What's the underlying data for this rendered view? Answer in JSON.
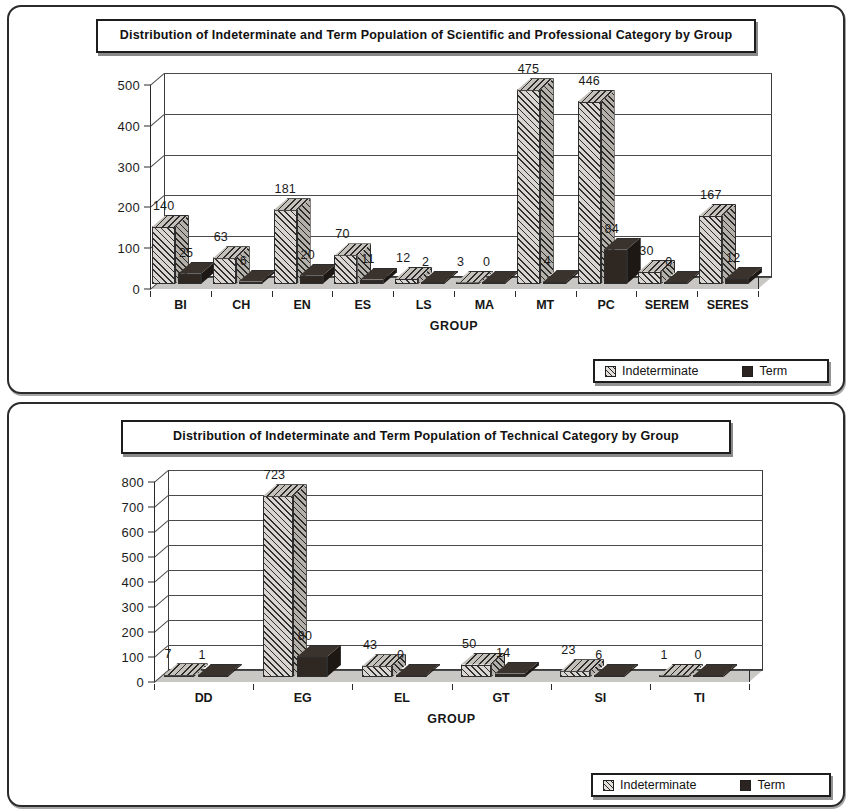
{
  "document": {
    "panels": [
      {
        "title": "Distribution of Indeterminate and Term Population of Scientific and Professional Category by Group",
        "axis_title": "GROUP",
        "legend": {
          "series_1": "Indeterminate",
          "series_2": "Term"
        }
      },
      {
        "title": "Distribution of Indeterminate and Term Population of Technical Category by Group",
        "axis_title": "GROUP",
        "legend": {
          "series_1": "Indeterminate",
          "series_2": "Term"
        }
      }
    ]
  },
  "chart_data": [
    {
      "type": "bar",
      "title": "Distribution of Indeterminate and Term Population of Scientific and Professional Category by Group",
      "xlabel": "GROUP",
      "ylabel": "",
      "ylim": [
        0,
        500
      ],
      "yticks": [
        0,
        100,
        200,
        300,
        400,
        500
      ],
      "grid": true,
      "legend_position": "bottom-right",
      "categories": [
        "BI",
        "CH",
        "EN",
        "ES",
        "LS",
        "MA",
        "MT",
        "PC",
        "SEREM",
        "SERES"
      ],
      "series": [
        {
          "name": "Indeterminate",
          "values": [
            140,
            63,
            181,
            70,
            12,
            3,
            475,
            446,
            30,
            167
          ]
        },
        {
          "name": "Term",
          "values": [
            25,
            6,
            20,
            11,
            2,
            0,
            4,
            84,
            0,
            12
          ]
        }
      ]
    },
    {
      "type": "bar",
      "title": "Distribution of Indeterminate and Term Population of Technical Category by Group",
      "xlabel": "GROUP",
      "ylabel": "",
      "ylim": [
        0,
        800
      ],
      "yticks": [
        0,
        100,
        200,
        300,
        400,
        500,
        600,
        700,
        800
      ],
      "grid": true,
      "legend_position": "bottom-right",
      "categories": [
        "DD",
        "EG",
        "EL",
        "GT",
        "SI",
        "TI"
      ],
      "series": [
        {
          "name": "Indeterminate",
          "values": [
            7,
            723,
            43,
            50,
            23,
            1
          ]
        },
        {
          "name": "Term",
          "values": [
            1,
            80,
            0,
            14,
            6,
            0
          ]
        }
      ]
    }
  ],
  "colors": {
    "indeterminate_fill": "#d9d6d1",
    "term_fill": "#2e2722",
    "gridline": "#4b4b4b",
    "border": "#2b2b2b",
    "text": "#161616"
  }
}
